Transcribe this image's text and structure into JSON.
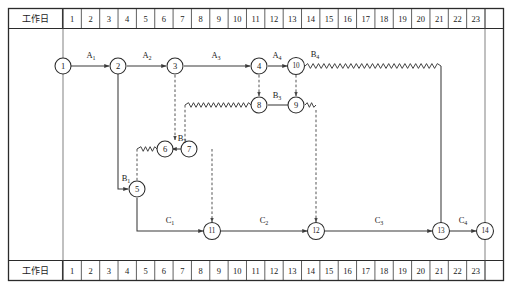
{
  "figure": {
    "kind": "time-scaled-network-diagram",
    "title_top": "工作日",
    "title_bottom": "工作日",
    "day_axis_label": "工作日",
    "days": [
      "1",
      "2",
      "3",
      "4",
      "5",
      "6",
      "7",
      "8",
      "9",
      "10",
      "11",
      "12",
      "13",
      "14",
      "15",
      "16",
      "17",
      "18",
      "19",
      "20",
      "21",
      "22",
      "23"
    ],
    "day_count": 23,
    "colors": {
      "frame": "#2b2b2b",
      "grid": "#4a4a4a",
      "solid": "#3a3a3a",
      "dashed": "#4a4a4a",
      "text": "#1a1a1a",
      "background": "#ffffff"
    }
  },
  "nodes": [
    {
      "id": "n1",
      "label": "1",
      "day": 0,
      "row": 1
    },
    {
      "id": "n2",
      "label": "2",
      "day": 2,
      "row": 1
    },
    {
      "id": "n3",
      "label": "3",
      "day": 5,
      "row": 1
    },
    {
      "id": "n4",
      "label": "4",
      "day": 10,
      "row": 1
    },
    {
      "id": "n10",
      "label": "10",
      "day": 12,
      "row": 1
    },
    {
      "id": "n8",
      "label": "8",
      "day": 10,
      "row": 2
    },
    {
      "id": "n9",
      "label": "9",
      "day": 12,
      "row": 2
    },
    {
      "id": "n6",
      "label": "6",
      "day": 5,
      "row": 3
    },
    {
      "id": "n7",
      "label": "7",
      "day": 6,
      "row": 3
    },
    {
      "id": "n5",
      "label": "5",
      "day": 4,
      "row": 4
    },
    {
      "id": "n11",
      "label": "11",
      "day": 9,
      "row": 5
    },
    {
      "id": "n12",
      "label": "12",
      "day": 13,
      "row": 5
    },
    {
      "id": "n13",
      "label": "13",
      "day": 21,
      "row": 5
    },
    {
      "id": "n14",
      "label": "14",
      "day": 23,
      "row": 5
    }
  ],
  "activities": [
    {
      "id": "a1",
      "name": "A",
      "sub": "1",
      "from": "n1",
      "to": "n2",
      "type": "solid"
    },
    {
      "id": "a2",
      "name": "A",
      "sub": "2",
      "from": "n2",
      "to": "n3",
      "type": "solid"
    },
    {
      "id": "a3",
      "name": "A",
      "sub": "3",
      "from": "n3",
      "to": "n4",
      "type": "solid"
    },
    {
      "id": "a4",
      "name": "A",
      "sub": "4",
      "from": "n4",
      "to": "n10",
      "type": "solid"
    },
    {
      "id": "b1",
      "name": "B",
      "sub": "1",
      "from": "n2",
      "to": "n5",
      "type": "solid"
    },
    {
      "id": "b2",
      "name": "B",
      "sub": "2",
      "from": "n6",
      "to": "n7",
      "type": "solid"
    },
    {
      "id": "b3",
      "name": "B",
      "sub": "3",
      "from": "n8",
      "to": "n9",
      "type": "solid"
    },
    {
      "id": "b4",
      "name": "B",
      "sub": "4",
      "from": "n10",
      "to": "n13",
      "type": "solid-with-wave"
    },
    {
      "id": "c1",
      "name": "C",
      "sub": "1",
      "from": "n5",
      "to": "n11",
      "type": "solid"
    },
    {
      "id": "c2",
      "name": "C",
      "sub": "2",
      "from": "n11",
      "to": "n12",
      "type": "solid"
    },
    {
      "id": "c3",
      "name": "C",
      "sub": "3",
      "from": "n12",
      "to": "n13",
      "type": "solid"
    },
    {
      "id": "c4",
      "name": "C",
      "sub": "4",
      "from": "n13",
      "to": "n14",
      "type": "solid"
    }
  ],
  "dummy_links": [
    {
      "id": "d1",
      "from": "n3",
      "to": "n6",
      "note": "vertical dashed"
    },
    {
      "id": "d2",
      "from": "n4",
      "to": "n8",
      "note": "vertical dashed"
    },
    {
      "id": "d3",
      "from": "n10",
      "to": "n9",
      "note": "vertical dashed"
    },
    {
      "id": "d4",
      "from": "n5",
      "to": "n6",
      "note": "wavy then dashed up"
    },
    {
      "id": "d5",
      "from": "n7",
      "to": "n11",
      "note": "dashed down"
    },
    {
      "id": "d6",
      "from": "n7",
      "to": "n8",
      "note": "wavy then dashed up"
    },
    {
      "id": "d7",
      "from": "n9",
      "to": "n12",
      "note": "wavy then dashed down"
    }
  ],
  "legend": {
    "wavy_meaning": "free float (waveline)",
    "dashed_meaning": "dummy / logical dependency",
    "solid_meaning": "activity duration"
  }
}
